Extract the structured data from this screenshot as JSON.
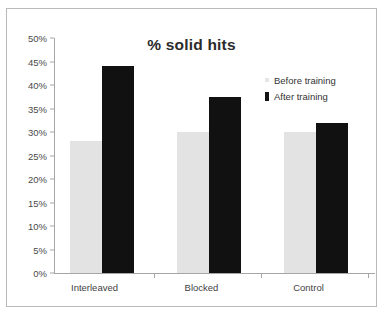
{
  "chart_data": {
    "type": "bar",
    "title": "% solid hits",
    "xlabel": "",
    "ylabel": "",
    "categories": [
      "Interleaved",
      "Blocked",
      "Control"
    ],
    "series": [
      {
        "name": "Before training",
        "values": [
          28,
          30,
          30
        ],
        "color": "#E3E3E3"
      },
      {
        "name": "After training",
        "values": [
          44,
          37.5,
          32
        ],
        "color": "#111111"
      }
    ],
    "ylim": [
      0,
      50
    ],
    "ytick_labels": [
      "50%",
      "45%",
      "40%",
      "35%",
      "30%",
      "25%",
      "20%",
      "15%",
      "10%",
      "5%",
      "0%"
    ],
    "ytick_values": [
      50,
      45,
      40,
      35,
      30,
      25,
      20,
      15,
      10,
      5,
      0
    ],
    "grid": false,
    "legend_position": "top-right"
  },
  "colors": {
    "before_training": "#E3E3E3",
    "after_training": "#111111",
    "axis": "#A6A6A6",
    "frame": "#B9B9B9",
    "text": "#333333",
    "background": "#FFFFFF"
  }
}
